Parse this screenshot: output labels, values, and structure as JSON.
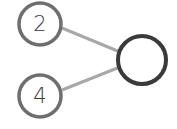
{
  "diagram": {
    "type": "tree",
    "nodes": [
      {
        "id": "n1",
        "label": "2",
        "role": "input"
      },
      {
        "id": "n2",
        "label": "4",
        "role": "input"
      },
      {
        "id": "n3",
        "label": "",
        "role": "output"
      }
    ],
    "edges": [
      {
        "from": "n1",
        "to": "n3"
      },
      {
        "from": "n2",
        "to": "n3"
      }
    ],
    "colors": {
      "input_stroke": "#6e6e6e",
      "output_stroke": "#3a3a3a",
      "edge": "#a8a8a8",
      "label": "#3c3c3c",
      "fill": "#ffffff"
    }
  }
}
